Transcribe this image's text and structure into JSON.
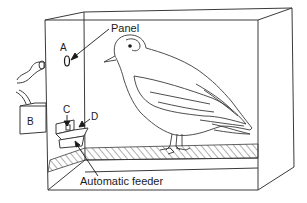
{
  "diagram": {
    "type": "illustration",
    "colors": {
      "stroke": "#3a3a3a",
      "text": "#1a1a1a",
      "background": "#ffffff"
    },
    "labels": {
      "panel": "Panel",
      "a": "A",
      "b": "B",
      "c": "C",
      "d": "D",
      "feeder": "Automatic feeder"
    },
    "elements": [
      {
        "id": "A",
        "description": "Response key (panel) on front wall"
      },
      {
        "id": "B",
        "description": "External box attached to left side"
      },
      {
        "id": "C",
        "description": "Feeder opening indicator"
      },
      {
        "id": "D",
        "description": "Feeder light/tray"
      },
      {
        "id": "feeder",
        "description": "Automatic feeder"
      },
      {
        "id": "bird",
        "description": "Pigeon standing on hatched grid floor"
      }
    ]
  }
}
